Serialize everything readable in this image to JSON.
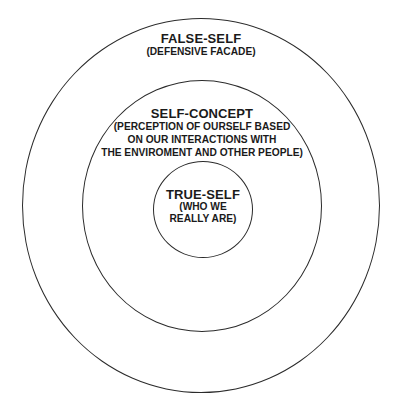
{
  "diagram": {
    "type": "concentric-circles",
    "stroke_color": "#2b2b2b",
    "background": "#ffffff",
    "layers": [
      {
        "id": "outer",
        "title": "FALSE-SELF",
        "lines": [
          "(DEFENSIVE FACADE)"
        ]
      },
      {
        "id": "middle",
        "title": "SELF-CONCEPT",
        "lines": [
          "(PERCEPTION OF OURSELF BASED",
          "ON OUR INTERACTIONS WITH",
          "THE ENVIROMENT AND OTHER PEOPLE)"
        ]
      },
      {
        "id": "inner",
        "title": "TRUE-SELF",
        "lines": [
          "(WHO WE",
          "REALLY ARE)"
        ]
      }
    ]
  }
}
